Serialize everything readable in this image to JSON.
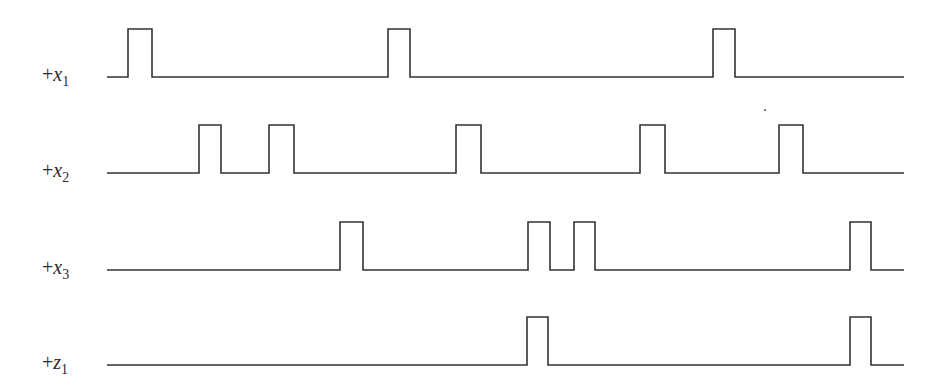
{
  "diagram": {
    "type": "pulse-timing-diagram",
    "stroke_color": "#333333",
    "line_start_x": 107,
    "line_end_x": 904,
    "pulse_height": 48,
    "signals": [
      {
        "id": "x1",
        "label_sign": "+",
        "label_var": "x",
        "label_sub": "1",
        "baseline_y": 77,
        "label_x": 42,
        "pulses": [
          [
            128,
            152
          ],
          [
            388,
            410
          ],
          [
            713,
            735
          ]
        ]
      },
      {
        "id": "x2",
        "label_sign": "+",
        "label_var": "x",
        "label_sub": "2",
        "baseline_y": 173,
        "label_x": 42,
        "pulses": [
          [
            199,
            221
          ],
          [
            269,
            294
          ],
          [
            456,
            481
          ],
          [
            640,
            665
          ],
          [
            779,
            803
          ]
        ]
      },
      {
        "id": "x3",
        "label_sign": "+",
        "label_var": "x",
        "label_sub": "3",
        "baseline_y": 270,
        "label_x": 42,
        "pulses": [
          [
            340,
            363
          ],
          [
            528,
            550
          ],
          [
            574,
            595
          ],
          [
            850,
            871
          ]
        ]
      },
      {
        "id": "z1",
        "label_sign": "+",
        "label_var": "z",
        "label_sub": "1",
        "baseline_y": 365,
        "label_x": 42,
        "pulses": [
          [
            527,
            548
          ],
          [
            850,
            871
          ]
        ]
      }
    ]
  }
}
